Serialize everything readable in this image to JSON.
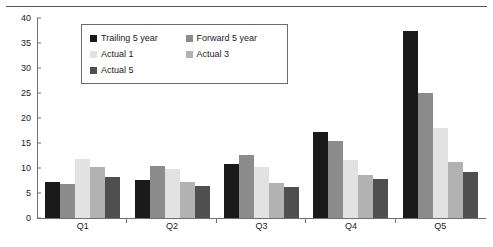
{
  "chart_data": {
    "type": "bar",
    "title": "",
    "xlabel": "",
    "ylabel": "",
    "categories": [
      "Q1",
      "Q2",
      "Q3",
      "Q4",
      "Q5"
    ],
    "ylim": [
      0,
      40
    ],
    "yticks": [
      0,
      5,
      10,
      15,
      20,
      25,
      30,
      35,
      40
    ],
    "ytick_labels": [
      "0",
      "5",
      "10",
      "15",
      "20",
      "25",
      "30",
      "35",
      "40"
    ],
    "grid": false,
    "legend_position": "upper-left-inside",
    "series": [
      {
        "name": "Trailing 5 year",
        "color": "#1a1a1a",
        "values": [
          7.3,
          7.7,
          10.8,
          17.3,
          37.5
        ]
      },
      {
        "name": "Forward 5 year",
        "color": "#8c8c8c",
        "values": [
          6.8,
          10.5,
          12.7,
          15.5,
          25.0
        ]
      },
      {
        "name": "Actual 1",
        "color": "#e2e2e2",
        "values": [
          11.8,
          9.8,
          10.2,
          11.7,
          18.0
        ]
      },
      {
        "name": "Actual 3",
        "color": "#b2b2b2",
        "values": [
          10.2,
          7.3,
          7.0,
          8.7,
          11.2
        ]
      },
      {
        "name": "Actual 5",
        "color": "#4f4f4f",
        "values": [
          8.2,
          6.5,
          6.3,
          7.8,
          9.3
        ]
      }
    ]
  },
  "legend": {
    "entries": [
      {
        "label": "Trailing 5 year"
      },
      {
        "label": "Forward 5 year"
      },
      {
        "label": "Actual 1"
      },
      {
        "label": "Actual 3"
      },
      {
        "label": "Actual 5"
      }
    ]
  },
  "axis": {
    "y_max_label": "40",
    "y_min_label": "0"
  }
}
